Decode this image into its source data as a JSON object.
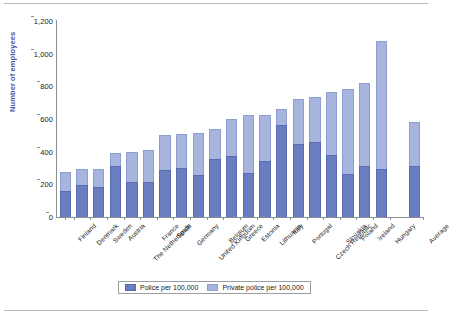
{
  "chart_data": {
    "type": "bar",
    "subtype": "stacked-column",
    "title": "",
    "xlabel": "",
    "ylabel": "Number of employees",
    "ylim": [
      0,
      1200
    ],
    "yticks": [
      "0",
      "200",
      "400",
      "600",
      "800",
      "1,000",
      "1,200"
    ],
    "ytick_values": [
      0,
      200,
      400,
      600,
      800,
      1000,
      1200
    ],
    "grid": false,
    "legend_position": "bottom-center",
    "categories": [
      "Finland",
      "Denmark",
      "Sweden",
      "Austria",
      "The Netherlands",
      "France",
      "Spain",
      "Germany",
      "United Kingdom",
      "Belgium",
      "Greece",
      "Estonia",
      "Lithuania",
      "Italy",
      "Portugal",
      "Czech Republic",
      "Slovakia",
      "Poland",
      "Ireland",
      "Hungary",
      "Average"
    ],
    "series": [
      {
        "name": "Police per 100,000",
        "color": "#6a7dc0",
        "values": [
          160,
          195,
          182,
          310,
          213,
          213,
          290,
          303,
          258,
          358,
          375,
          270,
          340,
          562,
          450,
          460,
          380,
          262,
          310,
          293,
          310
        ]
      },
      {
        "name": "Private police per 100,000",
        "color": "#a7b5de",
        "values": [
          118,
          100,
          115,
          80,
          186,
          196,
          215,
          208,
          256,
          181,
          228,
          352,
          286,
          98,
          272,
          275,
          387,
          523,
          508,
          782,
          272
        ]
      }
    ],
    "totals": [
      278,
      295,
      297,
      390,
      399,
      409,
      505,
      511,
      514,
      539,
      603,
      622,
      626,
      660,
      722,
      735,
      767,
      785,
      818,
      1075,
      582
    ],
    "gap_before_last": true
  },
  "legend": {
    "items": [
      {
        "label": "Police per 100,000",
        "swatch": "police"
      },
      {
        "label": "Private police per 100,000",
        "swatch": "private"
      }
    ]
  },
  "colors": {
    "police": "#6a7dc0",
    "private": "#a7b5de",
    "axis": "#8c8f96",
    "axis_title": "#3f51a8",
    "text": "#1a1a1a",
    "background": "#ffffff"
  }
}
